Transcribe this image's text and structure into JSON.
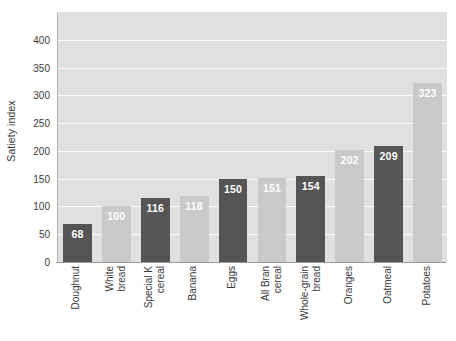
{
  "chart_data": {
    "type": "bar",
    "title": "",
    "xlabel": "",
    "ylabel": "Satiety index",
    "ylim": [
      0,
      450
    ],
    "ytick_step": 50,
    "grid": true,
    "legend": "none",
    "categories": [
      "Doughnut",
      "White bread",
      "Special K cereal",
      "Banana",
      "Eggs",
      "All Bran cereal",
      "Whole-grain bread",
      "Oranges",
      "Oatmeal",
      "Potatoes"
    ],
    "category_lines": [
      [
        "Doughnut"
      ],
      [
        "White",
        "bread"
      ],
      [
        "Special K",
        "cereal"
      ],
      [
        "Banana"
      ],
      [
        "Eggs"
      ],
      [
        "All Bran",
        "cereal"
      ],
      [
        "Whole-grain",
        "bread"
      ],
      [
        "Oranges"
      ],
      [
        "Oatmeal"
      ],
      [
        "Potatoes"
      ]
    ],
    "values": [
      68,
      100,
      116,
      118,
      150,
      151,
      154,
      202,
      209,
      323
    ],
    "yticks": [
      0,
      50,
      100,
      150,
      200,
      250,
      300,
      350,
      400
    ],
    "ytick_labels": [
      "0",
      "50",
      "100",
      "150",
      "200",
      "250",
      "300",
      "350",
      "400"
    ],
    "bar_colors": [
      "#555555",
      "#c9c9c9",
      "#555555",
      "#c9c9c9",
      "#555555",
      "#c9c9c9",
      "#555555",
      "#c9c9c9",
      "#555555",
      "#c9c9c9"
    ],
    "value_label_color": "#ffffff",
    "plot_background": "#e0e0e0",
    "gridline_color": "#fbfbfb",
    "figure_background": "#ffffff",
    "axis_color": "#9a9a9a",
    "tick_text_color": "#3a3a3a"
  }
}
